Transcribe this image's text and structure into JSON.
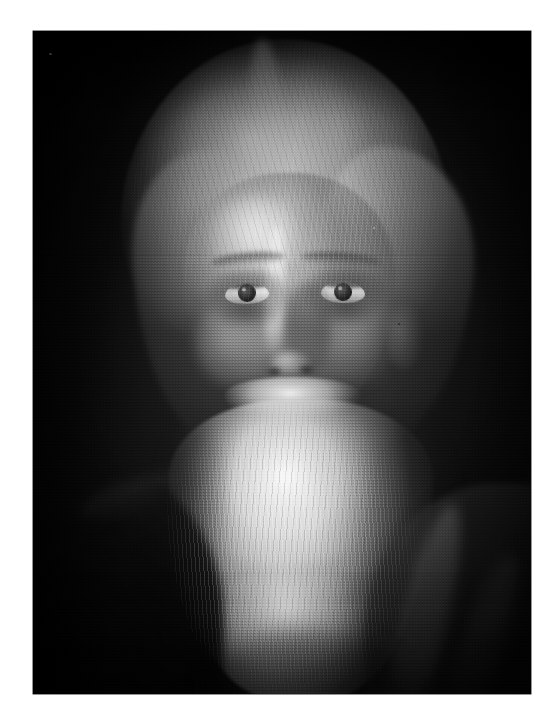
{
  "page": {
    "background_color": "#ffffff",
    "width": 560,
    "height": 719
  },
  "photograph": {
    "alt_text": "Black and white studio portrait of an elderly man with long white hair and a long flowing white beard, facing the camera against a dark background",
    "medium": "monochrome photographic print",
    "orientation": "portrait",
    "frame": {
      "left": 33,
      "top": 31,
      "width": 498,
      "height": 663
    },
    "palette": {
      "background_dark": "#1a191b",
      "background_deep_black": "#0a0a0b",
      "hair_highlight": "#fbfaf8",
      "beard_highlight": "#f6f5f2",
      "midtone_grey": "#8a8885",
      "skin_midtone": "#b0ada8",
      "shadow": "#2a2a2b",
      "paper_white": "#ffffff"
    },
    "subject": {
      "description": "elderly bearded man, bust portrait, three-quarter frontal",
      "features": [
        "long white hair swept back with a centre part",
        "high forehead lit from the left",
        "deep-set dark eyes gazing toward the viewer",
        "heavy brows",
        "long white moustache merging into the beard",
        "very long white beard reaching the bottom of the frame",
        "dark draped garment over the shoulders"
      ],
      "lighting": "single soft key light from upper left, strong falloff to near-black on the right and lower left"
    }
  },
  "labels": {
    "photo_region": "portrait-photograph",
    "margin_region": "page-margin"
  }
}
